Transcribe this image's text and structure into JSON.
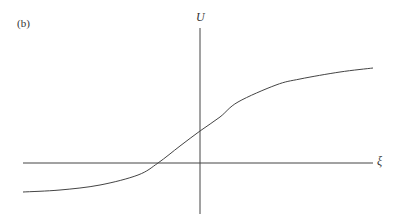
{
  "figure": {
    "panel_label": "(b)",
    "y_axis_label": "U",
    "x_axis_label": "ξ"
  },
  "chart_data": {
    "type": "line",
    "title": "(b)",
    "xlabel": "ξ",
    "ylabel": "U",
    "grid": false,
    "legend": null,
    "series": [
      {
        "name": "U(ξ)",
        "pixel_points": [
          [
            23,
            192
          ],
          [
            60,
            190
          ],
          [
            100,
            185
          ],
          [
            138,
            175
          ],
          [
            158,
            163
          ],
          [
            180,
            146
          ],
          [
            200,
            131
          ],
          [
            220,
            117
          ],
          [
            238,
            102
          ],
          [
            276,
            85
          ],
          [
            300,
            79
          ],
          [
            340,
            72
          ],
          [
            373,
            68
          ]
        ]
      }
    ],
    "axes_origin_px": [
      200,
      163
    ]
  }
}
